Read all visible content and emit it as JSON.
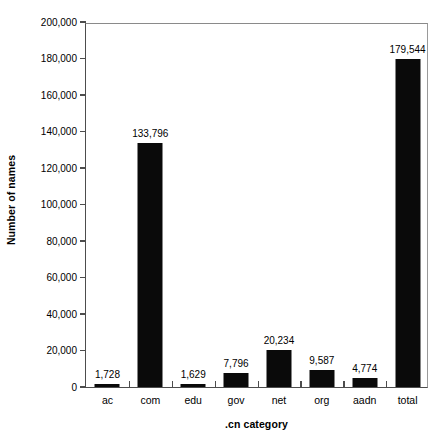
{
  "chart_data": {
    "type": "bar",
    "title": "",
    "subtitle": "",
    "xlabel": ".cn category",
    "ylabel": "Number of names",
    "categories": [
      "ac",
      "com",
      "edu",
      "gov",
      "net",
      "org",
      "aadn",
      "total"
    ],
    "values": [
      1728,
      133796,
      1629,
      7796,
      20234,
      9587,
      4774,
      179544
    ],
    "value_labels": [
      "1,728",
      "133,796",
      "1,629",
      "7,796",
      "20,234",
      "9,587",
      "4,774",
      "179,544"
    ],
    "ylim": [
      0,
      200000
    ],
    "ytick_values": [
      0,
      20000,
      40000,
      60000,
      80000,
      100000,
      120000,
      140000,
      160000,
      180000,
      200000
    ],
    "ytick_labels": [
      "0",
      "20,000",
      "40,000",
      "60,000",
      "80,000",
      "100,000",
      "120,000",
      "140,000",
      "160,000",
      "180,000",
      "200,000"
    ],
    "grid": false,
    "legend": false,
    "bar_color": "#0a0a0a",
    "background_color": "#ffffff",
    "axis_color": "#4d4d4d",
    "data_labels_shown": true,
    "orientation": "vertical"
  },
  "figure": {
    "y_axis_title": "Number of names",
    "x_axis_title": ".cn category"
  }
}
